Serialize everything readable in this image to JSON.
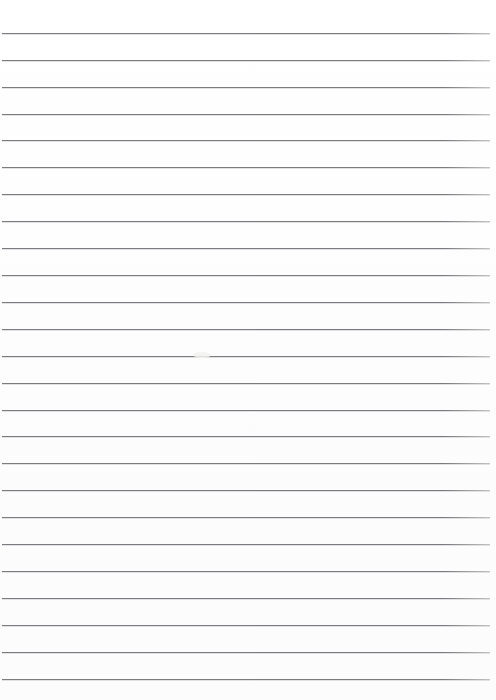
{
  "document": {
    "kind": "lined-paper",
    "title": "Blank lined paper",
    "text_content": "",
    "background_color": "#fefefe",
    "rule_color": "#6f7174",
    "rule_shadow_color": "#c9cacc"
  },
  "page": {
    "width": 496,
    "height": 700,
    "margin_left": 2,
    "margin_right": 6,
    "top_margin": 33
  },
  "ruling": {
    "count": 25,
    "first_line_y": 33,
    "spacing": 26.9,
    "thickness": 1,
    "line_start_x": 2,
    "line_end_x": 490,
    "y_positions": [
      33,
      60,
      87,
      114,
      140,
      167,
      194,
      221,
      248,
      275,
      302,
      329,
      356,
      383,
      410,
      436,
      463,
      490,
      517,
      544,
      571,
      598,
      625,
      652,
      679
    ]
  },
  "artifacts": {
    "smudge": {
      "x": 193,
      "y": 352,
      "width": 18,
      "height": 6
    }
  }
}
